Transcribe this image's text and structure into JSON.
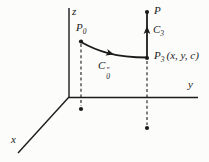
{
  "figure": {
    "type": "3d-coordinate-path-diagram",
    "colors": {
      "background": "#fcfcfa",
      "ink": "#1b1b1b"
    },
    "axes": {
      "z_label": "z",
      "y_label": "y",
      "x_label": "x"
    },
    "points": {
      "p0": {
        "base": "P",
        "sub": "0"
      },
      "p": {
        "base": "P"
      },
      "p3": {
        "base": "P",
        "sub": "3",
        "coords": "(x, y, c)"
      }
    },
    "curves": {
      "c0": {
        "base": "C",
        "sub": "0",
        "sup": "″"
      },
      "c3": {
        "base": "C",
        "sub": "3"
      }
    }
  }
}
